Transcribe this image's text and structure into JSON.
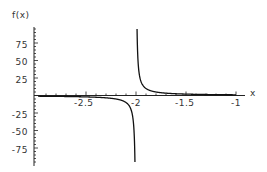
{
  "chart_data": {
    "type": "line",
    "title": "",
    "xlabel": "x",
    "ylabel": "f(x)",
    "function_shape": "vertical asymptote at x = -2; f -> -inf as x -> -2 from left, f -> +inf from right; approx f(x) = 1/(x+2)",
    "xlim": [
      -2.98,
      -1
    ],
    "ylim": [
      -95,
      95
    ],
    "x_ticks": [
      -2.5,
      -2,
      -1.5,
      -1
    ],
    "x_tick_labels": [
      "-2.5",
      "-2",
      "-1.5",
      "-1"
    ],
    "y_ticks": [
      -75,
      -50,
      -25,
      25,
      50,
      75
    ],
    "y_tick_labels": [
      "-75",
      "-50",
      "-25",
      "25",
      "50",
      "75"
    ],
    "series": [
      {
        "name": "f(x)",
        "x": [
          -2.98,
          -2.5,
          -2.2,
          -2.1,
          -2.05,
          -2.02,
          -2.011,
          -1.989,
          -1.98,
          -1.95,
          -1.9,
          -1.8,
          -1.5,
          -1.0
        ],
        "values": [
          -1.02,
          -2,
          -5,
          -10,
          -20,
          -50,
          -90,
          90,
          50,
          20,
          10,
          5,
          2,
          1
        ]
      }
    ],
    "grid": false,
    "legend": "none"
  },
  "labels": {
    "y_axis": "f(x)",
    "x_axis": "x",
    "x_ticks": [
      "-2.5",
      "-2",
      "-1.5",
      "-1"
    ],
    "y_ticks_pos": [
      "75",
      "50",
      "25"
    ],
    "y_ticks_neg": [
      "-25",
      "-50",
      "-75"
    ]
  }
}
